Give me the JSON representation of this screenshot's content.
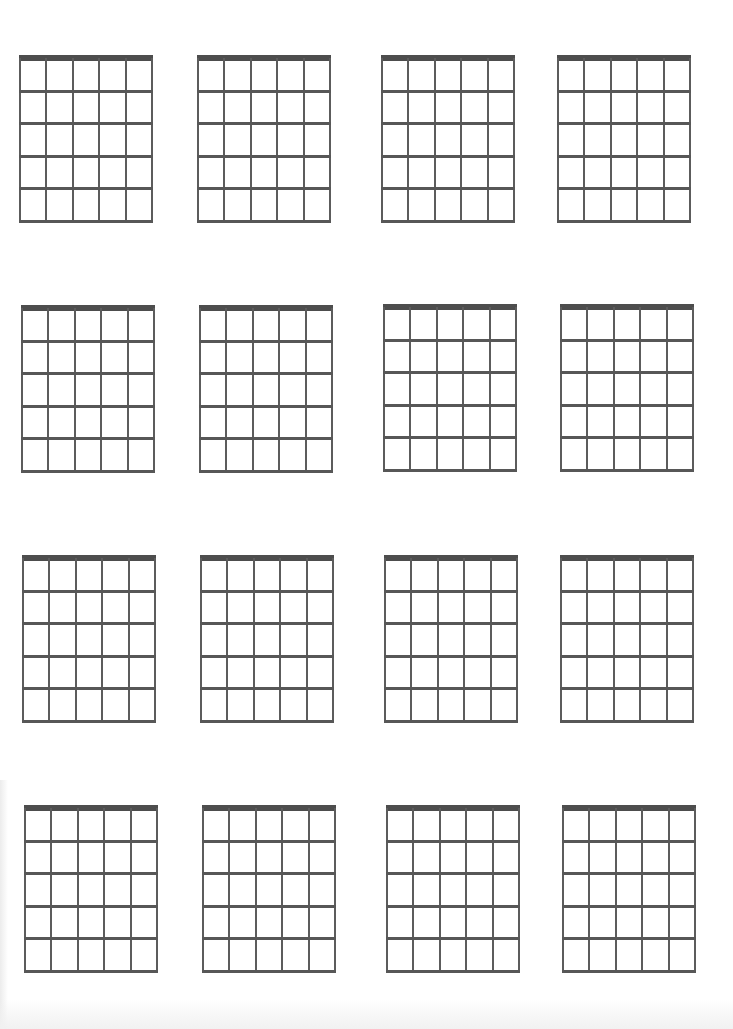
{
  "page": {
    "type": "blank-chord-chart-sheet",
    "background": "#ffffff",
    "line_color": "#555555"
  },
  "grid_spec": {
    "strings": 6,
    "frets": 5,
    "has_nut": true,
    "width_px": 134,
    "height_px": 168
  },
  "grids": [
    {
      "row": 1,
      "col": 1,
      "x": 19,
      "y": 55
    },
    {
      "row": 1,
      "col": 2,
      "x": 197,
      "y": 55
    },
    {
      "row": 1,
      "col": 3,
      "x": 381,
      "y": 55
    },
    {
      "row": 1,
      "col": 4,
      "x": 557,
      "y": 55
    },
    {
      "row": 2,
      "col": 1,
      "x": 21,
      "y": 305
    },
    {
      "row": 2,
      "col": 2,
      "x": 199,
      "y": 305
    },
    {
      "row": 2,
      "col": 3,
      "x": 383,
      "y": 304
    },
    {
      "row": 2,
      "col": 4,
      "x": 560,
      "y": 304
    },
    {
      "row": 3,
      "col": 1,
      "x": 22,
      "y": 555
    },
    {
      "row": 3,
      "col": 2,
      "x": 200,
      "y": 555
    },
    {
      "row": 3,
      "col": 3,
      "x": 384,
      "y": 555
    },
    {
      "row": 3,
      "col": 4,
      "x": 560,
      "y": 555
    },
    {
      "row": 4,
      "col": 1,
      "x": 24,
      "y": 805
    },
    {
      "row": 4,
      "col": 2,
      "x": 202,
      "y": 805
    },
    {
      "row": 4,
      "col": 3,
      "x": 386,
      "y": 805
    },
    {
      "row": 4,
      "col": 4,
      "x": 562,
      "y": 805
    }
  ]
}
